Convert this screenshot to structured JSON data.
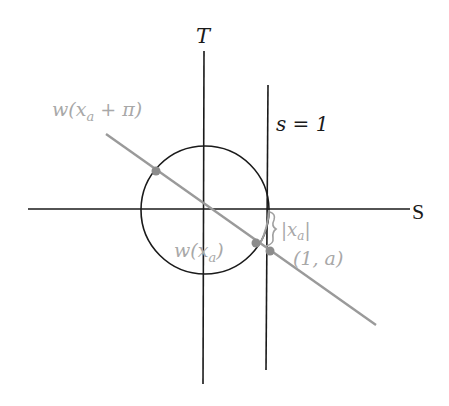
{
  "diagram": {
    "axes": {
      "horizontal_label": "S",
      "vertical_label": "T"
    },
    "vertical_line_label": "s = 1",
    "labels": {
      "point_opposite": "w(x",
      "point_opposite_sub": "a",
      "point_opposite_tail": " + π)",
      "point_main": "w(x",
      "point_main_sub": "a",
      "point_main_tail": ")",
      "point_tangent": "(1, a)",
      "arc_length_open": "|x",
      "arc_length_sub": "a",
      "arc_length_close": "|"
    },
    "colors": {
      "axis": "#1a1a1a",
      "circle": "#1a1a1a",
      "gray_line": "#9a9a9a",
      "gray_text": "#a8a8a8",
      "point": "#8c8c8c"
    },
    "geometry": {
      "origin": [
        204,
        209
      ],
      "circle_radius": 64,
      "vertical_line_x": 266
    }
  }
}
